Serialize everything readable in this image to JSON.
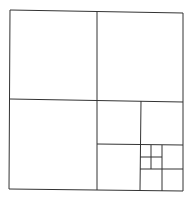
{
  "diagram": {
    "type": "recursive-square-subdivision",
    "stroke_color": "#333333",
    "background": "#ffffff",
    "lines": [
      {
        "x1": 10,
        "y1": 10,
        "x2": 183,
        "y2": 13
      },
      {
        "x1": 183,
        "y1": 13,
        "x2": 183,
        "y2": 191
      },
      {
        "x1": 183,
        "y1": 191,
        "x2": 9,
        "y2": 189
      },
      {
        "x1": 9,
        "y1": 189,
        "x2": 10,
        "y2": 10
      },
      {
        "x1": 97,
        "y1": 12,
        "x2": 97,
        "y2": 190
      },
      {
        "x1": 10,
        "y1": 99,
        "x2": 183,
        "y2": 102
      },
      {
        "x1": 141,
        "y1": 101,
        "x2": 140,
        "y2": 190
      },
      {
        "x1": 97,
        "y1": 144,
        "x2": 183,
        "y2": 145
      },
      {
        "x1": 162,
        "y1": 145,
        "x2": 162,
        "y2": 191
      },
      {
        "x1": 140,
        "y1": 169,
        "x2": 183,
        "y2": 169
      },
      {
        "x1": 151,
        "y1": 145,
        "x2": 151,
        "y2": 169
      },
      {
        "x1": 140,
        "y1": 157,
        "x2": 162,
        "y2": 157
      }
    ]
  }
}
